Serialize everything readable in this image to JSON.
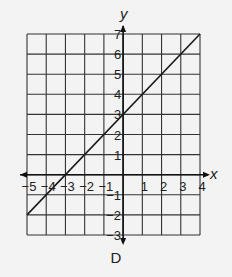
{
  "chart_data": {
    "type": "line",
    "title": "",
    "caption": "D",
    "xlabel": "x",
    "ylabel": "y",
    "xlim": [
      -5,
      4
    ],
    "ylim": [
      -3,
      7
    ],
    "grid": true,
    "x_ticks": [
      -5,
      -4,
      -3,
      -2,
      -1,
      1,
      2,
      3,
      4
    ],
    "y_ticks": [
      7,
      6,
      5,
      4,
      3,
      2,
      1,
      -1,
      -2,
      -3
    ],
    "x_tick_labels": [
      "−5",
      "−4",
      "−3",
      "−2",
      "−1",
      "1",
      "2",
      "3",
      "4"
    ],
    "y_tick_labels": [
      "7",
      "6",
      "5",
      "4",
      "3",
      "2",
      "1",
      "−1",
      "−2",
      "−3"
    ],
    "series": [
      {
        "name": "line",
        "equation": "y = x + 3",
        "slope": 1,
        "y_intercept": 3,
        "x_intercept": -3,
        "x": [
          -5,
          4
        ],
        "y": [
          -2,
          7
        ],
        "color": "#1a1a1a"
      }
    ],
    "colors": {
      "grid": "#333333",
      "axis": "#111111",
      "background": "#f3f3f3"
    }
  }
}
